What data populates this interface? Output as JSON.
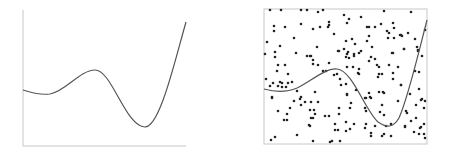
{
  "colors": {
    "background": "#ffffff",
    "curve": "#555555",
    "axis": "#c8c8c8",
    "box": "#c8c8c8",
    "point": "#222222"
  },
  "left_panel": {
    "axes": {
      "x0": 23,
      "y_top": 10,
      "y_axis_bottom": 146,
      "x_right": 186
    },
    "curve": "M23,90 C33,93 40,95 50,94 C65,92 80,70 95,70 C112,70 125,126 145,127 C160,127 175,60 186,22"
  },
  "right_panel": {
    "box": {
      "x": 264,
      "y": 9,
      "width": 163,
      "height": 135
    },
    "curve": "M264,89 C275,92 285,93 297,88 C310,82 325,68 337,69 C352,70 365,110 378,122 C387,128 393,128 399,118 C408,98 418,55 427,20",
    "points": [
      [
        270,
        10
      ],
      [
        281,
        10
      ],
      [
        301,
        10
      ],
      [
        307,
        10
      ],
      [
        274,
        26
      ],
      [
        285,
        27
      ],
      [
        301,
        24
      ],
      [
        274,
        31
      ],
      [
        294,
        38
      ],
      [
        267,
        42
      ],
      [
        280,
        46
      ],
      [
        265,
        54
      ],
      [
        275,
        52
      ],
      [
        296,
        53
      ],
      [
        318,
        12
      ],
      [
        323,
        10
      ],
      [
        344,
        15
      ],
      [
        349,
        19
      ],
      [
        347,
        23
      ],
      [
        329,
        22
      ],
      [
        329,
        25
      ],
      [
        328,
        27
      ],
      [
        320,
        27
      ],
      [
        313,
        29
      ],
      [
        334,
        34
      ],
      [
        346,
        41
      ],
      [
        352,
        39
      ],
      [
        355,
        44
      ],
      [
        317,
        47
      ],
      [
        339,
        51
      ],
      [
        344,
        49
      ],
      [
        348,
        52
      ],
      [
        354,
        54
      ],
      [
        384,
        11
      ],
      [
        361,
        17
      ],
      [
        367,
        27
      ],
      [
        369,
        27
      ],
      [
        375,
        27
      ],
      [
        381,
        24
      ],
      [
        393,
        23
      ],
      [
        394,
        28
      ],
      [
        387,
        31
      ],
      [
        389,
        33
      ],
      [
        369,
        36
      ],
      [
        388,
        38
      ],
      [
        394,
        38
      ],
      [
        400,
        35
      ],
      [
        402,
        36
      ],
      [
        367,
        41
      ],
      [
        372,
        47
      ],
      [
        361,
        51
      ],
      [
        392,
        53
      ],
      [
        404,
        49
      ],
      [
        411,
        12
      ],
      [
        401,
        35
      ],
      [
        408,
        33
      ],
      [
        415,
        39
      ],
      [
        425,
        30
      ],
      [
        404,
        49
      ],
      [
        417,
        47
      ],
      [
        418,
        50
      ],
      [
        275,
        57
      ],
      [
        307,
        56
      ],
      [
        310,
        56
      ],
      [
        278,
        65
      ],
      [
        285,
        65
      ],
      [
        277,
        71
      ],
      [
        288,
        74
      ],
      [
        266,
        79
      ],
      [
        280,
        82
      ],
      [
        282,
        83
      ],
      [
        273,
        83
      ],
      [
        292,
        82
      ],
      [
        270,
        86
      ],
      [
        278,
        86
      ],
      [
        282,
        87
      ],
      [
        286,
        87
      ],
      [
        288,
        83
      ],
      [
        297,
        91
      ],
      [
        272,
        97
      ],
      [
        301,
        97
      ],
      [
        311,
        56
      ],
      [
        313,
        60
      ],
      [
        318,
        65
      ],
      [
        313,
        64
      ],
      [
        329,
        63
      ],
      [
        338,
        51
      ],
      [
        347,
        54
      ],
      [
        346,
        57
      ],
      [
        354,
        56
      ],
      [
        349,
        58
      ],
      [
        358,
        73
      ],
      [
        353,
        67
      ],
      [
        347,
        67
      ],
      [
        323,
        71
      ],
      [
        326,
        71
      ],
      [
        334,
        75
      ],
      [
        337,
        74
      ],
      [
        340,
        79
      ],
      [
        346,
        84
      ],
      [
        341,
        85
      ],
      [
        315,
        92
      ],
      [
        347,
        94
      ],
      [
        356,
        90
      ],
      [
        359,
        53
      ],
      [
        393,
        53
      ],
      [
        371,
        57
      ],
      [
        375,
        59
      ],
      [
        369,
        61
      ],
      [
        377,
        65
      ],
      [
        379,
        67
      ],
      [
        389,
        65
      ],
      [
        398,
        67
      ],
      [
        359,
        69
      ],
      [
        359,
        74
      ],
      [
        379,
        74
      ],
      [
        382,
        74
      ],
      [
        378,
        77
      ],
      [
        393,
        73
      ],
      [
        393,
        79
      ],
      [
        401,
        85
      ],
      [
        369,
        93
      ],
      [
        379,
        92
      ],
      [
        383,
        92
      ],
      [
        384,
        93
      ],
      [
        366,
        98
      ],
      [
        371,
        98
      ],
      [
        418,
        51
      ],
      [
        422,
        56
      ],
      [
        415,
        71
      ],
      [
        419,
        72
      ],
      [
        401,
        85
      ],
      [
        410,
        94
      ],
      [
        419,
        89
      ],
      [
        422,
        99
      ],
      [
        272,
        98
      ],
      [
        294,
        101
      ],
      [
        300,
        99
      ],
      [
        305,
        102
      ],
      [
        301,
        105
      ],
      [
        290,
        108
      ],
      [
        278,
        111
      ],
      [
        310,
        110
      ],
      [
        287,
        114
      ],
      [
        284,
        120
      ],
      [
        287,
        120
      ],
      [
        311,
        118
      ],
      [
        309,
        125
      ],
      [
        275,
        137
      ],
      [
        271,
        140
      ],
      [
        297,
        135
      ],
      [
        311,
        102
      ],
      [
        318,
        102
      ],
      [
        314,
        110
      ],
      [
        313,
        118
      ],
      [
        315,
        114
      ],
      [
        325,
        116
      ],
      [
        329,
        116
      ],
      [
        351,
        103
      ],
      [
        339,
        108
      ],
      [
        350,
        108
      ],
      [
        339,
        114
      ],
      [
        346,
        122
      ],
      [
        354,
        124
      ],
      [
        310,
        126
      ],
      [
        335,
        124
      ],
      [
        335,
        130
      ],
      [
        338,
        130
      ],
      [
        346,
        131
      ],
      [
        350,
        129
      ],
      [
        313,
        141
      ],
      [
        330,
        142
      ],
      [
        332,
        141
      ],
      [
        340,
        141
      ],
      [
        347,
        95
      ],
      [
        365,
        98
      ],
      [
        370,
        97
      ],
      [
        398,
        101
      ],
      [
        365,
        108
      ],
      [
        366,
        111
      ],
      [
        380,
        112
      ],
      [
        382,
        105
      ],
      [
        384,
        115
      ],
      [
        366,
        124
      ],
      [
        365,
        128
      ],
      [
        375,
        126
      ],
      [
        386,
        126
      ],
      [
        391,
        124
      ],
      [
        405,
        126
      ],
      [
        371,
        133
      ],
      [
        371,
        136
      ],
      [
        382,
        136
      ],
      [
        384,
        134
      ],
      [
        391,
        136
      ],
      [
        421,
        100
      ],
      [
        425,
        101
      ],
      [
        416,
        105
      ],
      [
        424,
        108
      ],
      [
        406,
        111
      ],
      [
        407,
        113
      ],
      [
        416,
        118
      ],
      [
        411,
        121
      ],
      [
        405,
        127
      ],
      [
        424,
        124
      ],
      [
        421,
        127
      ],
      [
        420,
        128
      ],
      [
        414,
        132
      ],
      [
        419,
        134
      ],
      [
        424,
        134
      ],
      [
        425,
        138
      ]
    ]
  }
}
